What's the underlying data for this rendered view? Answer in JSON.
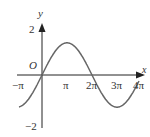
{
  "chart_data": {
    "type": "line",
    "title": "",
    "function": "y = 1.4 sin(x/2)",
    "xlabel": "x",
    "ylabel": "y",
    "origin_label": "O",
    "x_ticks": [
      "−π",
      "π",
      "2π",
      "3π",
      "4π"
    ],
    "y_ticks": [
      "2",
      "−2"
    ],
    "xlim": [
      "−π",
      "4π"
    ],
    "ylim": [
      -2,
      2
    ],
    "grid": false,
    "series": [
      {
        "name": "curve",
        "x": [
          "−π",
          "0",
          "π",
          "2π",
          "3π",
          "4π"
        ],
        "values": [
          -1.4,
          0,
          1.4,
          0,
          -1.4,
          0
        ]
      }
    ],
    "colors": {
      "axis": "#222222",
      "curve": "#555555"
    }
  }
}
